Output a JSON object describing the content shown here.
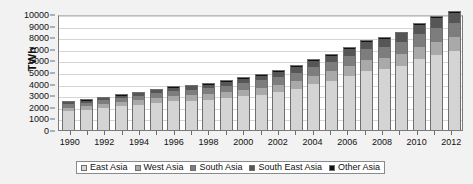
{
  "chart_data": {
    "type": "bar",
    "stacked": true,
    "title": "",
    "xlabel": "",
    "ylabel": "TWh",
    "ylim": [
      0,
      10000
    ],
    "ytick_step": 1000,
    "ytick_labels": [
      "0",
      "1000",
      "2000",
      "3000",
      "4000",
      "5000",
      "6000",
      "7000",
      "8000",
      "9000",
      "10000"
    ],
    "grid": true,
    "legend_position": "bottom",
    "categories": [
      "1990",
      "1991",
      "1992",
      "1993",
      "1994",
      "1995",
      "1996",
      "1997",
      "1998",
      "1999",
      "2000",
      "2001",
      "2002",
      "2003",
      "2004",
      "2005",
      "2006",
      "2007",
      "2008",
      "2009",
      "2010",
      "2011",
      "2012"
    ],
    "xtick_labels_shown": [
      "1990",
      "1992",
      "1994",
      "1996",
      "1998",
      "2000",
      "2002",
      "2004",
      "2006",
      "2008",
      "2010",
      "2012"
    ],
    "series": [
      {
        "name": "East Asia",
        "color": "#d4d4d4",
        "values": [
          1650,
          1750,
          1900,
          2030,
          2180,
          2360,
          2480,
          2540,
          2600,
          2730,
          2900,
          3060,
          3280,
          3560,
          3930,
          4260,
          4650,
          5120,
          5230,
          5540,
          6080,
          6480,
          6820
        ]
      },
      {
        "name": "West Asia",
        "color": "#a9a9a9",
        "values": [
          280,
          300,
          320,
          350,
          370,
          400,
          430,
          460,
          490,
          520,
          560,
          600,
          640,
          690,
          740,
          790,
          850,
          910,
          960,
          1010,
          1070,
          1130,
          1180
        ]
      },
      {
        "name": "South Asia",
        "color": "#7d7d7d",
        "values": [
          290,
          310,
          330,
          350,
          380,
          410,
          440,
          470,
          500,
          540,
          580,
          620,
          660,
          700,
          750,
          800,
          860,
          920,
          980,
          1040,
          1110,
          1180,
          1250
        ]
      },
      {
        "name": "South East Asia",
        "color": "#565656",
        "values": [
          160,
          180,
          200,
          220,
          240,
          260,
          290,
          310,
          330,
          350,
          380,
          410,
          440,
          470,
          510,
          550,
          600,
          650,
          700,
          740,
          790,
          840,
          880
        ]
      },
      {
        "name": "Other Asia",
        "color": "#111111",
        "values": [
          40,
          42,
          44,
          46,
          48,
          50,
          52,
          54,
          56,
          58,
          60,
          62,
          64,
          66,
          68,
          70,
          72,
          74,
          76,
          78,
          80,
          82,
          84
        ]
      }
    ],
    "totals": [
      2420,
      2582,
      2794,
      2996,
      3218,
      3480,
      3692,
      3834,
      3976,
      4198,
      4480,
      4752,
      5084,
      5486,
      5998,
      6470,
      7032,
      7674,
      7946,
      8408,
      9130,
      9712,
      10214
    ]
  },
  "legend": {
    "items": [
      {
        "label": "East Asia"
      },
      {
        "label": "West Asia"
      },
      {
        "label": "South Asia"
      },
      {
        "label": "South East Asia"
      },
      {
        "label": "Other Asia"
      }
    ]
  }
}
